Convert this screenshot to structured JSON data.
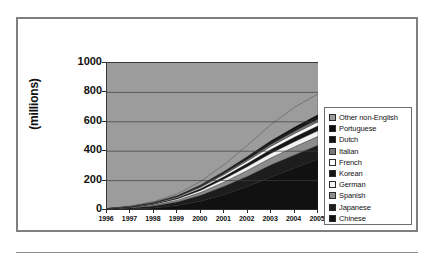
{
  "chart_data": {
    "type": "area",
    "stacked": true,
    "title": "",
    "xlabel": "",
    "ylabel": "(millions)",
    "ylim": [
      0,
      1000
    ],
    "ytick_step": 200,
    "ytick_labels": [
      "1000",
      "800",
      "600",
      "400",
      "200",
      "0"
    ],
    "grid": true,
    "legend_position": "right",
    "plot_background": "#9c9c9c",
    "categories": [
      "1996",
      "1997",
      "1998",
      "1999",
      "2000",
      "2001",
      "2002",
      "2003",
      "2004",
      "2005"
    ],
    "series": [
      {
        "name": "Chinese",
        "color": "#111111",
        "pattern": "solid",
        "values": [
          2,
          6,
          14,
          30,
          60,
          105,
          160,
          225,
          285,
          345
        ]
      },
      {
        "name": "Japanese",
        "color": "#1d1d1d",
        "pattern": "solid",
        "values": [
          3,
          7,
          14,
          25,
          40,
          56,
          70,
          82,
          90,
          96
        ]
      },
      {
        "name": "Spanish",
        "color": "#8c8c8c",
        "pattern": "solid",
        "values": [
          1,
          3,
          6,
          12,
          20,
          30,
          40,
          48,
          55,
          60
        ]
      },
      {
        "name": "German",
        "color": "#f2f2f2",
        "pattern": "solid",
        "values": [
          1,
          2,
          5,
          9,
          15,
          21,
          27,
          32,
          36,
          39
        ]
      },
      {
        "name": "Korean",
        "color": "#161616",
        "pattern": "solid",
        "values": [
          1,
          2,
          4,
          7,
          11,
          16,
          21,
          26,
          30,
          33
        ]
      },
      {
        "name": "French",
        "color": "#fafafa",
        "pattern": "solid",
        "values": [
          1,
          1,
          3,
          5,
          9,
          13,
          17,
          21,
          24,
          27
        ]
      },
      {
        "name": "Italian",
        "color": "#787878",
        "pattern": "solid",
        "values": [
          0,
          1,
          2,
          4,
          6,
          9,
          12,
          15,
          17,
          19
        ]
      },
      {
        "name": "Dutch",
        "color": "#121212",
        "pattern": "solid",
        "values": [
          0,
          1,
          2,
          3,
          5,
          7,
          9,
          11,
          13,
          14
        ]
      },
      {
        "name": "Portuguese",
        "color": "#0d0d0d",
        "pattern": "solid",
        "values": [
          0,
          1,
          2,
          3,
          5,
          7,
          10,
          12,
          14,
          16
        ]
      },
      {
        "name": "Other non-English",
        "color": "#9c9c9c",
        "pattern": "light-gray",
        "values": [
          1,
          3,
          6,
          12,
          24,
          45,
          75,
          110,
          135,
          141
        ]
      }
    ],
    "totals": [
      10,
      27,
      58,
      110,
      195,
      309,
      441,
      582,
      699,
      790
    ],
    "legend_order_top_to_bottom": [
      "Other non-English",
      "Portuguese",
      "Dutch",
      "Italian",
      "French",
      "Korean",
      "German",
      "Spanish",
      "Japanese",
      "Chinese"
    ]
  },
  "legend": {
    "items": [
      {
        "label": "Other non-English",
        "swatch": "#9c9c9c"
      },
      {
        "label": "Portuguese",
        "swatch": "#0d0d0d"
      },
      {
        "label": "Dutch",
        "swatch": "#121212"
      },
      {
        "label": "Italian",
        "swatch": "#787878"
      },
      {
        "label": "French",
        "swatch": "#fafafa"
      },
      {
        "label": "Korean",
        "swatch": "#161616"
      },
      {
        "label": "German",
        "swatch": "#f2f2f2"
      },
      {
        "label": "Spanish",
        "swatch": "#8c8c8c"
      },
      {
        "label": "Japanese",
        "swatch": "#1d1d1d"
      },
      {
        "label": "Chinese",
        "swatch": "#111111"
      }
    ]
  }
}
